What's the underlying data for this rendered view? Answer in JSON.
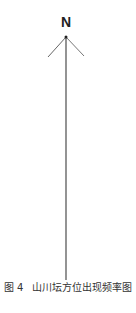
{
  "diagram": {
    "north_label": "N",
    "arrow_color": "#555555",
    "caption": {
      "figure_label": "图 4",
      "title": "山川坛方位出现频率图"
    }
  }
}
